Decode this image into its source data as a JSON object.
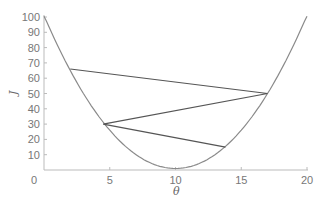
{
  "chart_data": {
    "type": "line",
    "title": "",
    "xlabel": "θ",
    "ylabel": "J",
    "xlim": [
      0,
      20
    ],
    "ylim": [
      0,
      100
    ],
    "x_ticks": [
      "0",
      "5",
      "10",
      "15",
      "20"
    ],
    "y_ticks": [
      "10",
      "20",
      "30",
      "40",
      "50",
      "60",
      "70",
      "80",
      "90",
      "100"
    ],
    "origin_label": "0",
    "grid": false,
    "legend": "none",
    "series": [
      {
        "name": "cost curve J(θ) = (θ-10)² + 1",
        "kind": "curve",
        "color": "#8a8a8a",
        "x": [
          0,
          2,
          4,
          6,
          8,
          10,
          12,
          14,
          16,
          18,
          20
        ],
        "y": [
          100,
          65,
          37,
          17,
          5,
          1,
          5,
          17,
          37,
          65,
          100
        ]
      },
      {
        "name": "gradient descent path",
        "kind": "polyline",
        "color": "#555555",
        "x": [
          2,
          17,
          4.5,
          13.8
        ],
        "y": [
          66,
          50,
          30,
          15
        ]
      }
    ]
  }
}
